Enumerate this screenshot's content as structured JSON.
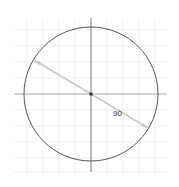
{
  "diagram": {
    "type": "circle-with-radius",
    "center": {
      "x": 91,
      "y": 94
    },
    "radius": 67,
    "dimension_label": "90",
    "colors": {
      "circle": "#555555",
      "axes": "#777777",
      "grid": "#eeeeee",
      "dimension_line": "#c8c8c8",
      "center_point": "#333333",
      "label": "#333333"
    }
  }
}
